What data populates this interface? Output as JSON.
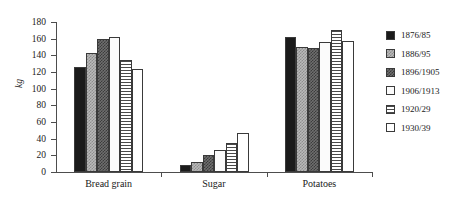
{
  "chart_data": {
    "type": "bar",
    "title": "",
    "xlabel": "",
    "ylabel": "kg",
    "ylim": [
      0,
      180
    ],
    "yticks": [
      0,
      20,
      40,
      60,
      80,
      100,
      120,
      140,
      160,
      180
    ],
    "grid": false,
    "legend_position": "right",
    "categories": [
      "Bread grain",
      "Sugar",
      "Potatoes"
    ],
    "series": [
      {
        "name": "1876/85",
        "values": [
          126,
          8,
          162
        ],
        "pattern": "solid-black"
      },
      {
        "name": "1886/95",
        "values": [
          143,
          12,
          150
        ],
        "pattern": "checker-light"
      },
      {
        "name": "1896/1905",
        "values": [
          160,
          21,
          149
        ],
        "pattern": "checker-dark"
      },
      {
        "name": "1906/1913",
        "values": [
          162,
          26,
          156
        ],
        "pattern": "white"
      },
      {
        "name": "1920/29",
        "values": [
          134,
          35,
          171
        ],
        "pattern": "hlines"
      },
      {
        "name": "1930/39",
        "values": [
          124,
          47,
          157
        ],
        "pattern": "open"
      }
    ]
  },
  "legend": {
    "items": [
      {
        "label": "1876/85",
        "pattern": "solid-black"
      },
      {
        "label": "1886/95",
        "pattern": "checker-light"
      },
      {
        "label": "1896/1905",
        "pattern": "checker-dark"
      },
      {
        "label": "1906/1913",
        "pattern": "white"
      },
      {
        "label": "1920/29",
        "pattern": "hlines"
      },
      {
        "label": "1930/39",
        "pattern": "open"
      }
    ]
  },
  "colors": {
    "axis": "#4d4d4d",
    "text": "#1a1a1a",
    "bar_outline": "#3a3a3a",
    "background": "#ffffff"
  }
}
